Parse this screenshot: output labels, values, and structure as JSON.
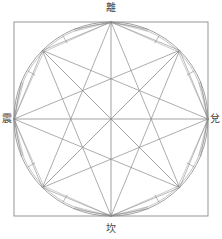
{
  "diagram": {
    "title": "",
    "center": [
      111,
      119
    ],
    "radius": 97,
    "square": {
      "x": 14,
      "y": 22,
      "w": 194,
      "h": 194
    },
    "stroke_color": "#8a8a8a",
    "label_color": "#444444",
    "labels": {
      "top": "離",
      "left": "震",
      "right": "兌",
      "bottom": "坎"
    }
  }
}
